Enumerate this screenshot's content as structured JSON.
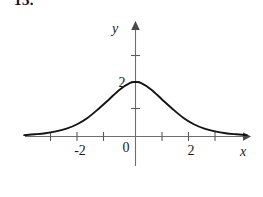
{
  "figure": {
    "problem_number": "13.",
    "background_color": "#ffffff",
    "width": 263,
    "height": 197
  },
  "chart_data": {
    "type": "line",
    "title": "",
    "subtitle": "",
    "xlabel": "x",
    "ylabel": "y",
    "grid": false,
    "legend": null,
    "xlim": [
      -4.2,
      4.3
    ],
    "ylim": [
      -0.95,
      3.45
    ],
    "x_ticks": [
      -3,
      -2,
      -1,
      1,
      2,
      3
    ],
    "x_tick_labels": [
      "",
      "-2",
      "",
      "",
      "2",
      ""
    ],
    "y_ticks": [
      1,
      2,
      3
    ],
    "y_tick_labels": [
      "",
      "2",
      ""
    ],
    "origin_label": "0",
    "peak": {
      "x": 0,
      "y": 2
    },
    "series": [
      {
        "name": "f(x)",
        "x": [
          -4.2,
          -3.8,
          -3.4,
          -3.0,
          -2.6,
          -2.2,
          -1.8,
          -1.4,
          -1.0,
          -0.6,
          -0.2,
          0.0,
          0.2,
          0.6,
          1.0,
          1.4,
          1.8,
          2.2,
          2.6,
          3.0,
          3.4,
          3.8,
          4.2
        ],
        "y": [
          0.05,
          0.08,
          0.12,
          0.19,
          0.29,
          0.45,
          0.69,
          1.01,
          1.36,
          1.72,
          1.97,
          2.0,
          1.97,
          1.72,
          1.36,
          1.01,
          0.69,
          0.45,
          0.29,
          0.19,
          0.12,
          0.08,
          0.05
        ]
      }
    ]
  },
  "labels": {
    "y_axis_name": "y",
    "x_axis_name": "x",
    "y_value_2": "2",
    "x_value_neg2": "-2",
    "x_value_2": "2",
    "origin": "0"
  },
  "colors": {
    "curve": "#141414",
    "axis": "#6e6e6e",
    "tick": "#5a5a5a",
    "text": "#1a1a1a",
    "background": "#ffffff"
  }
}
